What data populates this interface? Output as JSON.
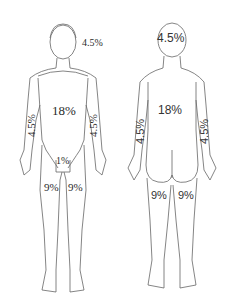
{
  "diagram": {
    "front_view": {
      "head": "4.5%",
      "trunk": "18%",
      "left_arm": "4.5%",
      "right_arm": "4.5%",
      "groin": "1%",
      "left_leg": "9%",
      "right_leg": "9%"
    },
    "back_view": {
      "head": "4.5%",
      "trunk": "18%",
      "left_arm": "4.5%",
      "right_arm": "4.5%",
      "left_leg": "9%",
      "right_leg": "9%"
    },
    "line_color": "#555555",
    "text_color": "#2a2a2a"
  }
}
